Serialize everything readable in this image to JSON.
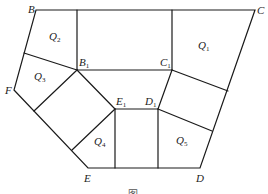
{
  "diagram": {
    "vertices": {
      "B": {
        "label": "B",
        "sub": ""
      },
      "C": {
        "label": "C",
        "sub": ""
      },
      "F": {
        "label": "F",
        "sub": ""
      },
      "E": {
        "label": "E",
        "sub": ""
      },
      "D": {
        "label": "D",
        "sub": ""
      },
      "B1": {
        "label": "B",
        "sub": "1"
      },
      "C1": {
        "label": "C",
        "sub": "1"
      },
      "D1": {
        "label": "D",
        "sub": "1"
      },
      "E1": {
        "label": "E",
        "sub": "1"
      }
    },
    "regions": {
      "Q1": {
        "label": "Q",
        "sub": "1"
      },
      "Q2": {
        "label": "Q",
        "sub": "2"
      },
      "Q3": {
        "label": "Q",
        "sub": "3"
      },
      "Q4": {
        "label": "Q",
        "sub": "4"
      },
      "Q5": {
        "label": "Q",
        "sub": "5"
      }
    },
    "caption": "图"
  }
}
